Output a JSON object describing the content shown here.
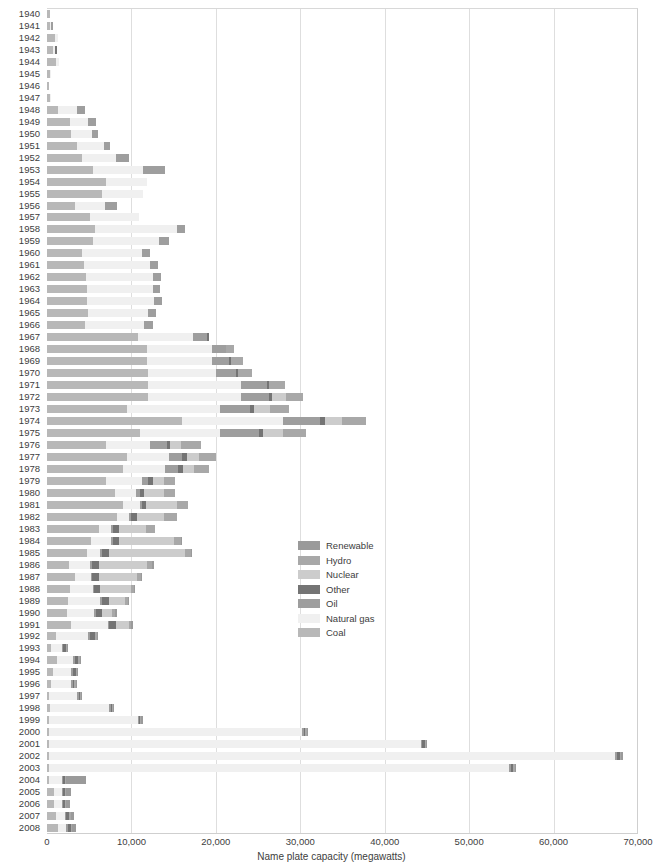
{
  "chart_data": {
    "type": "bar",
    "orientation": "horizontal",
    "stacked": true,
    "title": "",
    "xlabel": "Name plate capacity (megawatts)",
    "ylabel": "",
    "xlim": [
      0,
      70000
    ],
    "xticks": [
      0,
      10000,
      20000,
      30000,
      40000,
      50000,
      60000,
      70000
    ],
    "xtick_labels": [
      "0",
      "10,000",
      "20,000",
      "30,000",
      "40,000",
      "50,000",
      "60,000",
      "70,000"
    ],
    "grid": "vertical",
    "legend_position": "center",
    "series_order": [
      "Coal",
      "Natural gas",
      "Oil",
      "Other",
      "Nuclear",
      "Hydro",
      "Renewable"
    ],
    "colors": {
      "Renewable": "#9a9a9a",
      "Hydro": "#a8a8a8",
      "Nuclear": "#cccccc",
      "Other": "#747474",
      "Oil": "#9e9e9e",
      "Natural gas": "#f0f0f0",
      "Coal": "#b8b8b8"
    },
    "categories": [
      "1940",
      "1941",
      "1942",
      "1943",
      "1944",
      "1945",
      "1946",
      "1947",
      "1948",
      "1949",
      "1950",
      "1951",
      "1952",
      "1953",
      "1954",
      "1955",
      "1956",
      "1957",
      "1958",
      "1959",
      "1960",
      "1961",
      "1962",
      "1963",
      "1964",
      "1965",
      "1966",
      "1967",
      "1968",
      "1969",
      "1970",
      "1971",
      "1972",
      "1973",
      "1974",
      "1975",
      "1976",
      "1977",
      "1978",
      "1979",
      "1980",
      "1981",
      "1982",
      "1983",
      "1984",
      "1985",
      "1986",
      "1987",
      "1988",
      "1989",
      "1990",
      "1991",
      "1992",
      "1993",
      "1994",
      "1995",
      "1996",
      "1997",
      "1998",
      "1999",
      "2000",
      "2001",
      "2002",
      "2003",
      "2004",
      "2005",
      "2006",
      "2007",
      "2008"
    ],
    "series": [
      {
        "name": "Coal",
        "values": [
          380,
          350,
          900,
          700,
          1100,
          330,
          230,
          330,
          1300,
          2700,
          2900,
          3600,
          4200,
          5500,
          7000,
          6500,
          3300,
          5100,
          5700,
          5500,
          4200,
          4400,
          4600,
          4700,
          4700,
          4900,
          4500,
          10800,
          11800,
          11800,
          12000,
          12000,
          12000,
          9500,
          16000,
          11000,
          7000,
          9500,
          9000,
          7000,
          8000,
          9000,
          8300,
          6200,
          5200,
          4700,
          2600,
          3300,
          2700,
          2500,
          2400,
          2800,
          1100,
          500,
          1200,
          700,
          500,
          200,
          300,
          250,
          250,
          250,
          250,
          250,
          250,
          800,
          800,
          1100,
          1300
        ]
      },
      {
        "name": "Natural gas",
        "values": [
          0,
          170,
          400,
          290,
          300,
          130,
          0,
          190,
          2300,
          2200,
          2400,
          3200,
          4000,
          5900,
          4800,
          4900,
          3600,
          5800,
          9700,
          7800,
          7100,
          7800,
          8000,
          7800,
          8000,
          7100,
          7000,
          6500,
          7800,
          7800,
          8000,
          11000,
          11000,
          11000,
          12000,
          9500,
          5200,
          5000,
          5000,
          4200,
          2600,
          2000,
          1400,
          1400,
          2400,
          1600,
          2500,
          1900,
          2700,
          3800,
          3200,
          4400,
          3800,
          1300,
          1900,
          2200,
          2400,
          3400,
          7100,
          10500,
          30000,
          44000,
          67000,
          54500,
          1500,
          1000,
          1000,
          1000,
          1000
        ]
      },
      {
        "name": "Oil",
        "values": [
          0,
          130,
          0,
          0,
          0,
          0,
          0,
          0,
          850,
          900,
          750,
          700,
          1500,
          2600,
          0,
          0,
          1400,
          0,
          1000,
          1100,
          950,
          950,
          900,
          900,
          900,
          900,
          1000,
          1600,
          1600,
          2000,
          2400,
          3100,
          3300,
          3500,
          4300,
          4600,
          2000,
          1500,
          1500,
          800,
          400,
          250,
          250,
          250,
          250,
          200,
          200,
          150,
          200,
          200,
          200,
          200,
          200,
          150,
          200,
          200,
          150,
          100,
          100,
          100,
          150,
          200,
          250,
          200,
          150,
          150,
          150,
          150,
          150
        ]
      },
      {
        "name": "Other",
        "values": [
          0,
          0,
          0,
          60,
          0,
          0,
          0,
          0,
          0,
          0,
          0,
          0,
          0,
          0,
          0,
          0,
          0,
          0,
          0,
          0,
          0,
          0,
          0,
          0,
          0,
          0,
          0,
          300,
          0,
          200,
          250,
          250,
          400,
          500,
          600,
          500,
          400,
          600,
          600,
          500,
          500,
          500,
          700,
          700,
          700,
          900,
          900,
          800,
          700,
          800,
          700,
          800,
          600,
          300,
          400,
          300,
          200,
          100,
          100,
          150,
          200,
          300,
          400,
          300,
          200,
          200,
          200,
          400,
          400
        ]
      },
      {
        "name": "Nuclear",
        "values": [
          0,
          0,
          0,
          0,
          0,
          0,
          0,
          0,
          0,
          0,
          0,
          0,
          0,
          0,
          0,
          0,
          0,
          0,
          0,
          0,
          0,
          0,
          0,
          0,
          0,
          0,
          0,
          0,
          0,
          0,
          0,
          0,
          1600,
          1900,
          2100,
          2300,
          1300,
          1400,
          1300,
          1400,
          2400,
          3600,
          3200,
          3200,
          6500,
          8900,
          5700,
          4500,
          3600,
          1900,
          1200,
          1500,
          0,
          0,
          0,
          0,
          0,
          0,
          0,
          0,
          0,
          0,
          0,
          0,
          0,
          0,
          0,
          0,
          0
        ]
      },
      {
        "name": "Hydro",
        "values": [
          0,
          0,
          0,
          0,
          0,
          0,
          0,
          0,
          0,
          0,
          0,
          0,
          0,
          0,
          0,
          0,
          0,
          0,
          0,
          0,
          0,
          0,
          0,
          0,
          0,
          0,
          0,
          0,
          1000,
          1400,
          1600,
          1800,
          2000,
          2300,
          2800,
          2800,
          2300,
          2000,
          1800,
          1300,
          1300,
          1300,
          1500,
          1000,
          800,
          700,
          600,
          500,
          400,
          400,
          400,
          300,
          200,
          100,
          200,
          100,
          100,
          100,
          100,
          100,
          100,
          100,
          100,
          100,
          100,
          100,
          100,
          100,
          100
        ]
      },
      {
        "name": "Renewable",
        "values": [
          0,
          0,
          0,
          0,
          0,
          0,
          0,
          0,
          0,
          0,
          0,
          0,
          0,
          0,
          0,
          0,
          0,
          0,
          0,
          0,
          0,
          0,
          0,
          0,
          0,
          0,
          0,
          0,
          0,
          0,
          0,
          0,
          0,
          0,
          0,
          0,
          0,
          0,
          0,
          0,
          0,
          0,
          0,
          0,
          100,
          100,
          100,
          100,
          100,
          100,
          100,
          100,
          100,
          100,
          100,
          100,
          100,
          100,
          100,
          100,
          100,
          100,
          100,
          100,
          2400,
          500,
          400,
          400,
          400
        ]
      }
    ]
  },
  "legend": {
    "entries": [
      {
        "label": "Renewable"
      },
      {
        "label": "Hydro"
      },
      {
        "label": "Nuclear"
      },
      {
        "label": "Other"
      },
      {
        "label": "Oil"
      },
      {
        "label": "Natural gas"
      },
      {
        "label": "Coal"
      }
    ]
  }
}
